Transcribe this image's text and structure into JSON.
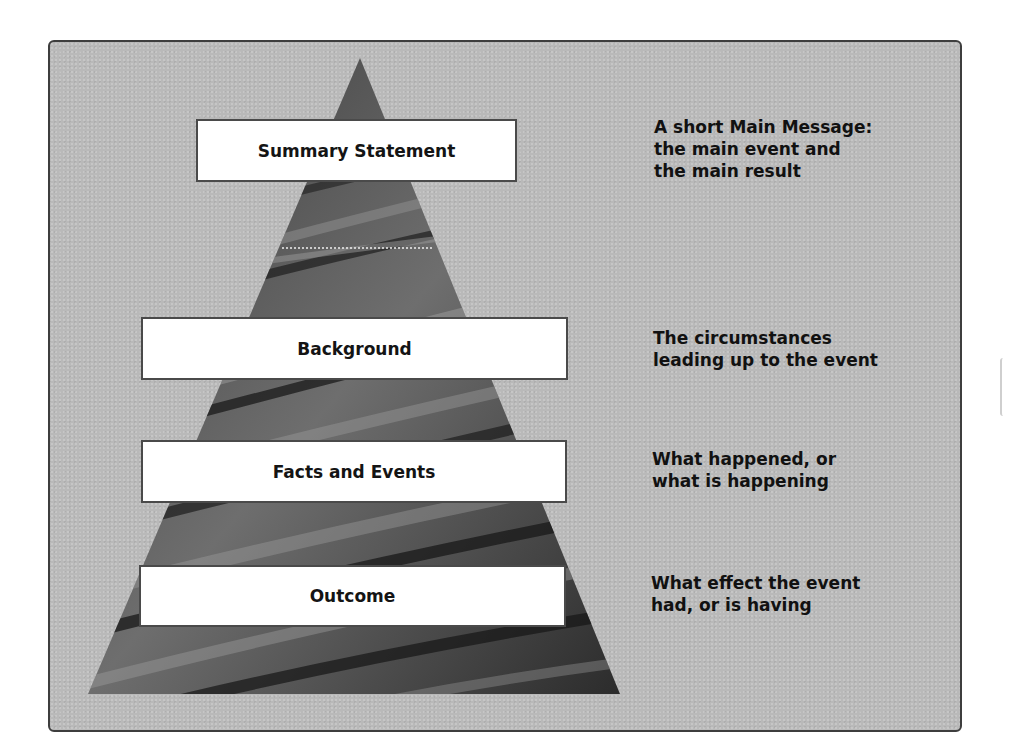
{
  "diagram": {
    "type": "inverted-pyramid",
    "colors": {
      "panel_bg": "#b9b9b9",
      "panel_border": "#3e3e3e",
      "pyramid_dark": "#2f2f2f",
      "pyramid_light": "#8a8a8a",
      "box_bg": "#ffffff",
      "text": "#111111"
    },
    "levels": [
      {
        "label": "Summary Statement",
        "description": "A short Main Message:\nthe main event and\nthe main result"
      },
      {
        "label": "Background",
        "description": "The circumstances\nleading up to the event"
      },
      {
        "label": "Facts and Events",
        "description": "What happened, or\nwhat is happening"
      },
      {
        "label": "Outcome",
        "description": "What effect the event\nhad, or is having"
      }
    ]
  }
}
